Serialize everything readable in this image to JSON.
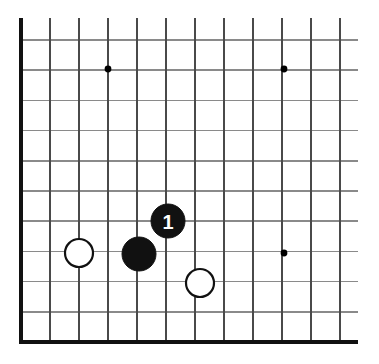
{
  "figure": {
    "kind": "go-board-corner-diagram",
    "background_color": "#ffffff",
    "width": 379,
    "height": 364
  },
  "board": {
    "grid_color": "#6f6f6f",
    "edge_color": "#111111",
    "origin_x": 21,
    "origin_y": 40,
    "spacing": 29.0,
    "spacing_y": 30.2,
    "columns": 12,
    "rows": 11,
    "line_overrun_right": 18,
    "left_edge_is_board_border": true,
    "bottom_edge_is_board_border": true,
    "top_edge_is_board_border": false,
    "right_edge_is_board_border": false
  },
  "star_points": [
    {
      "label": "star-point-upper-left",
      "col": 3,
      "row": 0,
      "x": 108,
      "y": 69
    },
    {
      "label": "star-point-upper-right",
      "col": 9,
      "row": 0,
      "x": 284,
      "y": 69
    },
    {
      "label": "star-point-lower-right",
      "col": 9,
      "row": 6,
      "x": 284,
      "y": 253
    }
  ],
  "stones": [
    {
      "id": "white-stone-left",
      "color": "white",
      "color_hex": "#ffffff",
      "outline_hex": "#111111",
      "col": 2,
      "row": 6,
      "x": 79,
      "y": 253,
      "radius": 14,
      "number": ""
    },
    {
      "id": "black-stone-center",
      "color": "black",
      "color_hex": "#111111",
      "outline_hex": "#111111",
      "col": 4,
      "row": 6,
      "x": 139,
      "y": 254,
      "radius": 17,
      "number": ""
    },
    {
      "id": "black-stone-move-1",
      "color": "black",
      "color_hex": "#111111",
      "outline_hex": "#111111",
      "col": 5,
      "row": 5,
      "x": 168,
      "y": 221,
      "radius": 17,
      "number": "1"
    },
    {
      "id": "white-stone-lower",
      "color": "white",
      "color_hex": "#ffffff",
      "outline_hex": "#111111",
      "col": 6,
      "row": 7,
      "x": 200,
      "y": 283,
      "radius": 14,
      "number": ""
    }
  ],
  "move_labels": [
    {
      "text": "1",
      "stone_id": "black-stone-move-1",
      "text_color": "#ffffff"
    }
  ]
}
